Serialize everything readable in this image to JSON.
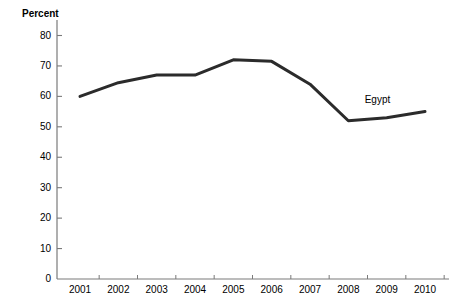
{
  "chart_data": {
    "type": "line",
    "title": "",
    "subtitle": "",
    "xlabel": "",
    "ylabel": "Percent",
    "categories": [
      "2001",
      "2002",
      "2003",
      "2004",
      "2005",
      "2006",
      "2007",
      "2008",
      "2009",
      "2010"
    ],
    "x": [
      2001,
      2002,
      2003,
      2004,
      2005,
      2006,
      2007,
      2008,
      2009,
      2010
    ],
    "series": [
      {
        "name": "Egypt",
        "values": [
          60,
          64.5,
          67,
          67,
          72,
          71.5,
          64,
          52,
          53,
          55
        ],
        "color": "#2b2b2b"
      }
    ],
    "ylim": [
      0,
      80
    ],
    "yticks": [
      0,
      10,
      20,
      30,
      40,
      50,
      60,
      70,
      80
    ],
    "ytick_labels": [
      "0",
      "10",
      "20",
      "30",
      "40",
      "50",
      "60",
      "70",
      "80"
    ],
    "xlim": [
      2000.6,
      2010.6
    ],
    "grid": false,
    "legend": "inline-series-label",
    "annotations": [
      {
        "text": "Egypt",
        "x": 2009.0,
        "y": 58.5
      }
    ]
  },
  "axes": {
    "y_axis_title": "Percent",
    "y_tick_labels": [
      "80",
      "70",
      "60",
      "50",
      "40",
      "30",
      "20",
      "10",
      "0"
    ],
    "x_tick_labels": [
      "2001",
      "2002",
      "2003",
      "2004",
      "2005",
      "2006",
      "2007",
      "2008",
      "2009",
      "2010"
    ],
    "axis_color": "#7a7a7a"
  },
  "series_labels": {
    "egypt": "Egypt"
  },
  "colors": {
    "line": "#2b2b2b",
    "axis": "#7a7a7a",
    "text": "#000000",
    "background": "#ffffff"
  }
}
